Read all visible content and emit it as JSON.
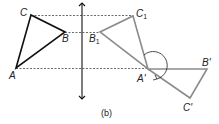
{
  "caption": "(b)",
  "labels": {
    "A": "A",
    "B": "B",
    "C": "C",
    "A1": "A'",
    "B1": "B1",
    "C1": "C1",
    "Ap": "A'",
    "Bp": "B'",
    "Cp": "C'"
  },
  "subscript": "1",
  "colors": {
    "original_triangle": "#111111",
    "reflected_triangle": "#8c8c8c",
    "rotated_triangle": "#8c8c8c",
    "axis": "#111111",
    "dashed": "#444444"
  }
}
